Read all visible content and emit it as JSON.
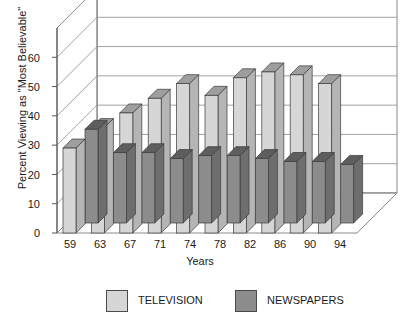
{
  "chart_data": {
    "type": "bar",
    "title": "Credibility of News Media",
    "xlabel": "Years",
    "ylabel": "Percent Viewing as \"Most Believable\"",
    "categories": [
      "59",
      "63",
      "67",
      "71",
      "74",
      "78",
      "82",
      "86",
      "90",
      "94"
    ],
    "ylim": [
      0,
      70
    ],
    "yticks": [
      "0",
      "10",
      "20",
      "30",
      "40",
      "50",
      "60"
    ],
    "grid": true,
    "legend_position": "bottom",
    "projection": "3d",
    "series": [
      {
        "name": "TELEVISION",
        "color": "#d6d6d6",
        "values": [
          29,
          36,
          41,
          46,
          51,
          47,
          53,
          55,
          54,
          51
        ]
      },
      {
        "name": "NEWSPAPERS",
        "color": "#8c8c8c",
        "values": [
          32,
          24,
          24,
          22,
          23,
          23,
          22,
          21,
          21,
          20
        ]
      }
    ]
  },
  "legend": {
    "items": [
      {
        "label": "TELEVISION"
      },
      {
        "label": "NEWSPAPERS"
      }
    ]
  },
  "colors": {
    "television": "#d6d6d6",
    "newspapers": "#8c8c8c",
    "television_top": "#9e9e9e",
    "newspapers_top": "#5e5e5e",
    "television_side": "#b5b5b5",
    "newspapers_side": "#6e6e6e",
    "axis": "#555555",
    "grid": "#8a8a8a",
    "floor": "#ffffff"
  }
}
